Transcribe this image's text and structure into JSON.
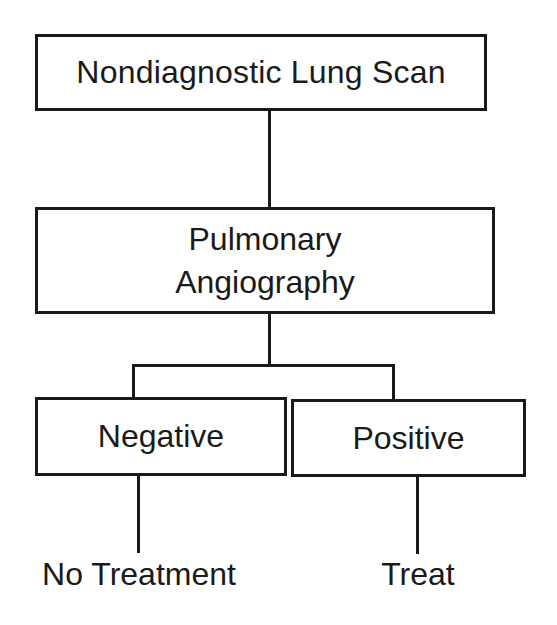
{
  "diagram": {
    "type": "flowchart",
    "nodes": {
      "root": {
        "label": "Nondiagnostic Lung Scan"
      },
      "test": {
        "label_line1": "Pulmonary",
        "label_line2": "Angiography"
      },
      "negative": {
        "label": "Negative"
      },
      "positive": {
        "label": "Positive"
      }
    },
    "outcomes": {
      "negative": "No Treatment",
      "positive": "Treat"
    },
    "edges": [
      {
        "from": "Nondiagnostic Lung Scan",
        "to": "Pulmonary Angiography"
      },
      {
        "from": "Pulmonary Angiography",
        "to": "Negative"
      },
      {
        "from": "Pulmonary Angiography",
        "to": "Positive"
      },
      {
        "from": "Negative",
        "to": "No Treatment"
      },
      {
        "from": "Positive",
        "to": "Treat"
      }
    ],
    "colors": {
      "stroke": "#1a1a1a",
      "background": "#ffffff"
    }
  }
}
